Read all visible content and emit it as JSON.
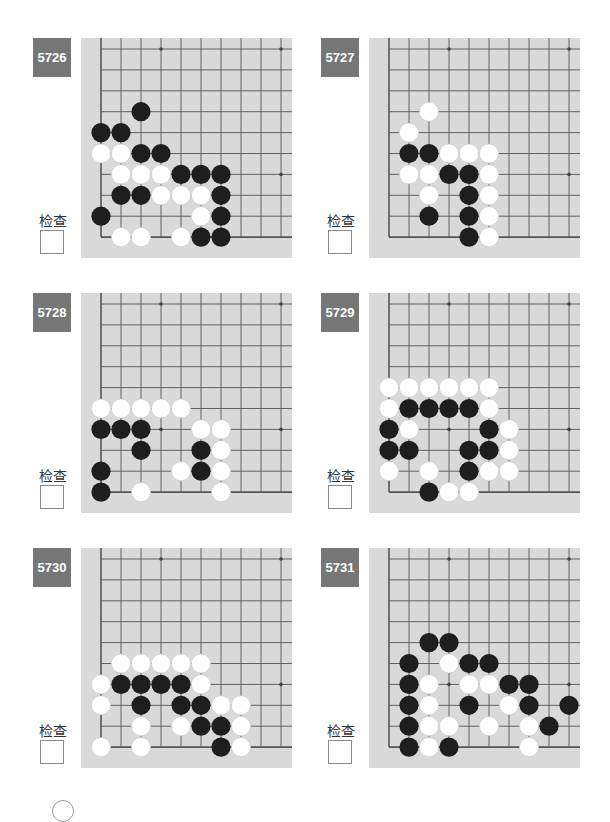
{
  "page": {
    "check_label": "检查",
    "colors": {
      "badge_bg": "#767676",
      "badge_text": "#ffffff",
      "board_bg": "#d9d9d9",
      "grid_line": "#555555",
      "black_stone": "#1e1e1e",
      "white_stone": "#ffffff"
    }
  },
  "problems": [
    {
      "number": "5726",
      "stones": {
        "black": [
          [
            2,
            3
          ],
          [
            0,
            4
          ],
          [
            1,
            4
          ],
          [
            2,
            5
          ],
          [
            3,
            5
          ],
          [
            4,
            6
          ],
          [
            5,
            6
          ],
          [
            6,
            6
          ],
          [
            1,
            7
          ],
          [
            2,
            7
          ],
          [
            6,
            7
          ],
          [
            0,
            8
          ],
          [
            6,
            8
          ],
          [
            5,
            9
          ],
          [
            6,
            9
          ]
        ],
        "white": [
          [
            0,
            5
          ],
          [
            1,
            5
          ],
          [
            1,
            6
          ],
          [
            2,
            6
          ],
          [
            3,
            6
          ],
          [
            3,
            7
          ],
          [
            4,
            7
          ],
          [
            5,
            7
          ],
          [
            5,
            8
          ],
          [
            1,
            9
          ],
          [
            2,
            9
          ],
          [
            4,
            9
          ]
        ]
      }
    },
    {
      "number": "5727",
      "stones": {
        "black": [
          [
            1,
            5
          ],
          [
            2,
            5
          ],
          [
            3,
            6
          ],
          [
            4,
            6
          ],
          [
            4,
            7
          ],
          [
            2,
            8
          ],
          [
            4,
            8
          ],
          [
            4,
            9
          ]
        ],
        "white": [
          [
            2,
            3
          ],
          [
            1,
            4
          ],
          [
            3,
            5
          ],
          [
            4,
            5
          ],
          [
            5,
            5
          ],
          [
            1,
            6
          ],
          [
            2,
            6
          ],
          [
            5,
            6
          ],
          [
            2,
            7
          ],
          [
            5,
            7
          ],
          [
            5,
            8
          ],
          [
            5,
            9
          ]
        ]
      }
    },
    {
      "number": "5728",
      "stones": {
        "black": [
          [
            0,
            6
          ],
          [
            1,
            6
          ],
          [
            2,
            6
          ],
          [
            2,
            7
          ],
          [
            5,
            7
          ],
          [
            0,
            8
          ],
          [
            5,
            8
          ],
          [
            0,
            9
          ]
        ],
        "white": [
          [
            0,
            5
          ],
          [
            1,
            5
          ],
          [
            2,
            5
          ],
          [
            3,
            5
          ],
          [
            4,
            5
          ],
          [
            5,
            6
          ],
          [
            6,
            6
          ],
          [
            6,
            7
          ],
          [
            4,
            8
          ],
          [
            6,
            8
          ],
          [
            2,
            9
          ],
          [
            6,
            9
          ]
        ]
      }
    },
    {
      "number": "5729",
      "stones": {
        "black": [
          [
            1,
            5
          ],
          [
            2,
            5
          ],
          [
            3,
            5
          ],
          [
            4,
            5
          ],
          [
            0,
            6
          ],
          [
            5,
            6
          ],
          [
            0,
            7
          ],
          [
            1,
            7
          ],
          [
            4,
            7
          ],
          [
            5,
            7
          ],
          [
            4,
            8
          ],
          [
            2,
            9
          ]
        ],
        "white": [
          [
            0,
            4
          ],
          [
            1,
            4
          ],
          [
            2,
            4
          ],
          [
            3,
            4
          ],
          [
            4,
            4
          ],
          [
            5,
            4
          ],
          [
            0,
            5
          ],
          [
            5,
            5
          ],
          [
            1,
            6
          ],
          [
            6,
            6
          ],
          [
            6,
            7
          ],
          [
            0,
            8
          ],
          [
            2,
            8
          ],
          [
            5,
            8
          ],
          [
            6,
            8
          ],
          [
            3,
            9
          ],
          [
            4,
            9
          ]
        ]
      }
    },
    {
      "number": "5730",
      "stones": {
        "black": [
          [
            1,
            6
          ],
          [
            2,
            6
          ],
          [
            3,
            6
          ],
          [
            4,
            6
          ],
          [
            2,
            7
          ],
          [
            4,
            7
          ],
          [
            5,
            7
          ],
          [
            5,
            8
          ],
          [
            6,
            8
          ],
          [
            6,
            9
          ]
        ],
        "white": [
          [
            1,
            5
          ],
          [
            2,
            5
          ],
          [
            3,
            5
          ],
          [
            4,
            5
          ],
          [
            5,
            5
          ],
          [
            0,
            6
          ],
          [
            5,
            6
          ],
          [
            0,
            7
          ],
          [
            6,
            7
          ],
          [
            7,
            7
          ],
          [
            2,
            8
          ],
          [
            4,
            8
          ],
          [
            7,
            8
          ],
          [
            0,
            9
          ],
          [
            2,
            9
          ],
          [
            7,
            9
          ]
        ]
      }
    },
    {
      "number": "5731",
      "stones": {
        "black": [
          [
            2,
            4
          ],
          [
            3,
            4
          ],
          [
            1,
            5
          ],
          [
            4,
            5
          ],
          [
            5,
            5
          ],
          [
            1,
            6
          ],
          [
            6,
            6
          ],
          [
            7,
            6
          ],
          [
            1,
            7
          ],
          [
            4,
            7
          ],
          [
            7,
            7
          ],
          [
            9,
            7
          ],
          [
            1,
            8
          ],
          [
            8,
            8
          ],
          [
            1,
            9
          ],
          [
            3,
            9
          ]
        ],
        "white": [
          [
            3,
            5
          ],
          [
            2,
            6
          ],
          [
            4,
            6
          ],
          [
            5,
            6
          ],
          [
            2,
            7
          ],
          [
            6,
            7
          ],
          [
            2,
            8
          ],
          [
            3,
            8
          ],
          [
            5,
            8
          ],
          [
            7,
            8
          ],
          [
            2,
            9
          ],
          [
            7,
            9
          ]
        ]
      }
    }
  ],
  "board_geometry": {
    "cols": 10,
    "rows": 10,
    "star_points": [
      [
        3,
        0
      ],
      [
        9,
        0
      ],
      [
        3,
        6
      ],
      [
        9,
        6
      ]
    ]
  }
}
